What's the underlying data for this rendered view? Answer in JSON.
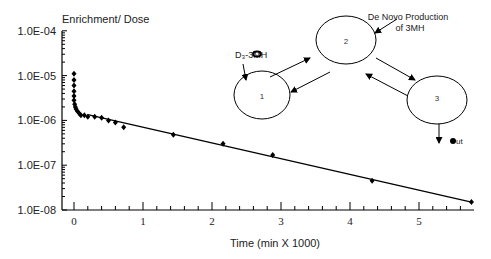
{
  "chart_data": {
    "type": "scatter",
    "title": "",
    "ylabel": "Enrichment/ Dose",
    "xlabel": "Time (min X 1000)",
    "yscale": "log",
    "ylim": [
      1e-08,
      0.0001
    ],
    "xlim": [
      -0.2,
      5.8
    ],
    "yticks": [
      "1.0E-04",
      "1.0E-05",
      "1.0E-06",
      "1.0E-07",
      "1.0E-08"
    ],
    "xticks": [
      "0",
      "1",
      "2",
      "3",
      "4",
      "5"
    ],
    "series": [
      {
        "name": "data",
        "x": [
          0,
          0,
          0,
          0,
          0,
          0,
          0.01,
          0.02,
          0.03,
          0.05,
          0.08,
          0.1,
          0.15,
          0.2,
          0.3,
          0.4,
          0.5,
          0.6,
          0.72,
          1.44,
          2.16,
          2.88,
          4.32,
          5.76
        ],
        "y": [
          1.1e-05,
          8e-06,
          6e-06,
          4.5e-06,
          3.5e-06,
          2.8e-06,
          2.3e-06,
          2e-06,
          1.8e-06,
          1.6e-06,
          1.4e-06,
          1.3e-06,
          1.3e-06,
          1.2e-06,
          1.2e-06,
          1.15e-06,
          1e-06,
          9e-07,
          7e-07,
          4.8e-07,
          3e-07,
          1.7e-07,
          4.5e-08,
          1.5e-08
        ]
      },
      {
        "name": "fit",
        "x": [
          0.2,
          5.76
        ],
        "y": [
          1.35e-06,
          1.5e-08
        ]
      }
    ],
    "grid": false,
    "legend": null
  },
  "diagram": {
    "pools": [
      "1",
      "2",
      "3"
    ],
    "input_label": "D3-3MH",
    "production_label_line1": "De Novo Production",
    "production_label_line2": "of  3MH",
    "out_label": "out"
  }
}
